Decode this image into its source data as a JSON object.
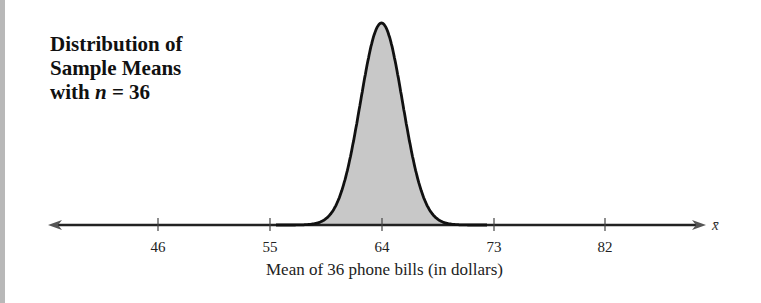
{
  "chart_data": {
    "type": "area",
    "title_lines": [
      "Distribution of",
      "Sample Means",
      "with n = 36"
    ],
    "title_line3_prefix": "with ",
    "title_line3_var": "n",
    "title_line3_suffix": " = 36",
    "xlabel": "Mean of 36 phone bills (in dollars)",
    "axis_symbol": "x̄",
    "ticks": [
      46,
      55,
      64,
      73,
      82
    ],
    "tick_labels": [
      "46",
      "55",
      "64",
      "73",
      "82"
    ],
    "distribution": "normal",
    "mean": 64,
    "std_dev_approx": 2,
    "sample_size": 36,
    "xlim": [
      40,
      88
    ],
    "fill_color": "#c8c8c8",
    "curve_color": "#111111"
  }
}
